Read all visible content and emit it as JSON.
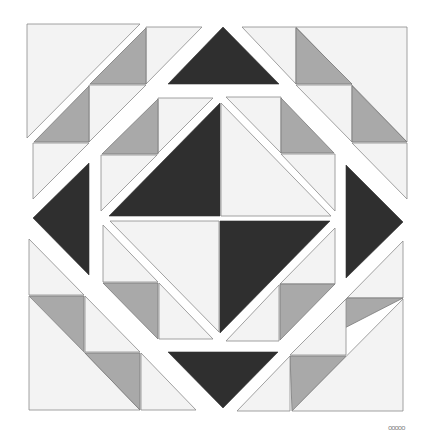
{
  "diagram": {
    "kind": "quilt-block",
    "colors": {
      "background": "#ffffff",
      "light": "#f3f3f3",
      "medium": "#a9a9a9",
      "dark": "#2f2f2f",
      "outline": "#8a8a8a"
    },
    "signature": "ooooo"
  }
}
